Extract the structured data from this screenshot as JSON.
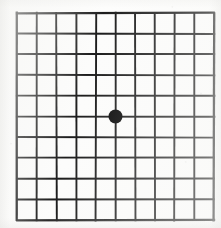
{
  "document": {
    "title": "Amsler Grid",
    "kind": "amsler-grid-eye-test-chart",
    "medium": "scanned printed chart"
  },
  "canvas": {
    "width": 221,
    "height": 228,
    "background_color": "#fdfdfc",
    "paper_tone": "#fcfcfb"
  },
  "chart_data": {
    "type": "heatmap",
    "subtitle": "",
    "xlabel": "",
    "ylabel": "",
    "grid": true,
    "legend_position": "none",
    "columns": 10,
    "rows": 10,
    "cell_count": 100,
    "vertical_lines": 11,
    "horizontal_lines": 11,
    "x": [
      0,
      1,
      2,
      3,
      4,
      5,
      6,
      7,
      8,
      9,
      10
    ],
    "y": [
      0,
      1,
      2,
      3,
      4,
      5,
      6,
      7,
      8,
      9,
      10
    ],
    "xlim": [
      0,
      10
    ],
    "ylim": [
      0,
      10
    ],
    "categories": [
      "c1",
      "c2",
      "c3",
      "c4",
      "c5",
      "c6",
      "c7",
      "c8",
      "c9",
      "c10"
    ],
    "values": [
      [
        0,
        0,
        0,
        0,
        0,
        0,
        0,
        0,
        0,
        0
      ],
      [
        0,
        0,
        0,
        0,
        0,
        0,
        0,
        0,
        0,
        0
      ],
      [
        0,
        0,
        0,
        0,
        0,
        0,
        0,
        0,
        0,
        0
      ],
      [
        0,
        0,
        0,
        0,
        0,
        0,
        0,
        0,
        0,
        0
      ],
      [
        0,
        0,
        0,
        0,
        0,
        0,
        0,
        0,
        0,
        0
      ],
      [
        0,
        0,
        0,
        0,
        0,
        0,
        0,
        0,
        0,
        0
      ],
      [
        0,
        0,
        0,
        0,
        0,
        0,
        0,
        0,
        0,
        0
      ],
      [
        0,
        0,
        0,
        0,
        0,
        0,
        0,
        0,
        0,
        0
      ],
      [
        0,
        0,
        0,
        0,
        0,
        0,
        0,
        0,
        0,
        0
      ],
      [
        0,
        0,
        0,
        0,
        0,
        0,
        0,
        0,
        0,
        0
      ]
    ],
    "annotations": [
      {
        "name": "central-fixation-dot",
        "shape": "filled-circle",
        "x": 5,
        "y": 5,
        "radius_px": 7,
        "diameter_px": 14,
        "color": "#090909"
      }
    ],
    "tick_labels_x": [],
    "tick_labels_y": [],
    "line_color": "#1c1c1c",
    "line_width_px": 2,
    "border_width_px": 2.3
  },
  "geometry": {
    "grid_left": 14,
    "grid_top": 10,
    "grid_width": 197,
    "grid_height": 207,
    "cell_width": 19.7,
    "cell_height": 20.7,
    "dot_center_x": 113,
    "dot_center_y": 113,
    "dot_radius": 7
  },
  "colors": {
    "line": "#1c1c1c",
    "dot": "#090909",
    "paper": "#fdfdfc",
    "cell": "#fcfcfb"
  }
}
